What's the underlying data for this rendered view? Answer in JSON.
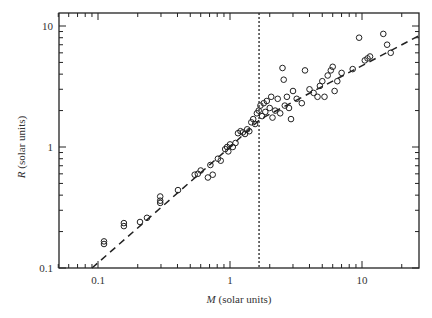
{
  "chart_data": {
    "type": "scatter",
    "title": "",
    "xlabel": "M (solar units)",
    "xlabel_var": "M",
    "xlabel_unit": " (solar units)",
    "ylabel": "R (solar units)",
    "ylabel_var": "R",
    "ylabel_unit": " (solar units)",
    "xscale": "log",
    "yscale": "log",
    "xlim": [
      0.05,
      27
    ],
    "ylim": [
      0.1,
      12.8
    ],
    "x_ticks": [
      0.1,
      1,
      10
    ],
    "x_tick_labels": [
      "0.1",
      "1",
      "10"
    ],
    "y_ticks": [
      0.1,
      1,
      10
    ],
    "y_tick_labels": [
      "0.1",
      "1",
      "10"
    ],
    "grid": false,
    "legend": null,
    "series": [
      {
        "name": "stars",
        "marker": "open-circle",
        "points": [
          [
            0.111,
            0.158
          ],
          [
            0.111,
            0.166
          ],
          [
            0.157,
            0.222
          ],
          [
            0.157,
            0.235
          ],
          [
            0.208,
            0.24
          ],
          [
            0.235,
            0.26
          ],
          [
            0.296,
            0.345
          ],
          [
            0.296,
            0.36
          ],
          [
            0.296,
            0.39
          ],
          [
            0.404,
            0.44
          ],
          [
            0.54,
            0.59
          ],
          [
            0.57,
            0.6
          ],
          [
            0.6,
            0.64
          ],
          [
            0.68,
            0.56
          ],
          [
            0.71,
            0.71
          ],
          [
            0.74,
            0.59
          ],
          [
            0.81,
            0.8
          ],
          [
            0.85,
            0.77
          ],
          [
            0.92,
            0.96
          ],
          [
            0.95,
            1.0
          ],
          [
            0.97,
            0.92
          ],
          [
            1.0,
            1.05
          ],
          [
            1.05,
            1.0
          ],
          [
            1.1,
            1.08
          ],
          [
            1.15,
            1.3
          ],
          [
            1.2,
            1.35
          ],
          [
            1.25,
            1.32
          ],
          [
            1.3,
            1.28
          ],
          [
            1.35,
            1.4
          ],
          [
            1.4,
            1.35
          ],
          [
            1.45,
            1.6
          ],
          [
            1.5,
            1.7
          ],
          [
            1.55,
            1.55
          ],
          [
            1.6,
            1.9
          ],
          [
            1.65,
            2.0
          ],
          [
            1.7,
            2.2
          ],
          [
            1.75,
            1.8
          ],
          [
            1.8,
            2.3
          ],
          [
            1.85,
            1.95
          ],
          [
            1.9,
            2.4
          ],
          [
            2.0,
            2.1
          ],
          [
            2.05,
            2.6
          ],
          [
            2.1,
            1.75
          ],
          [
            2.2,
            2.0
          ],
          [
            2.3,
            2.5
          ],
          [
            2.4,
            1.9
          ],
          [
            2.5,
            4.5
          ],
          [
            2.55,
            3.6
          ],
          [
            2.6,
            2.2
          ],
          [
            2.7,
            2.6
          ],
          [
            2.8,
            2.1
          ],
          [
            2.9,
            1.7
          ],
          [
            3.0,
            2.9
          ],
          [
            3.2,
            2.5
          ],
          [
            3.5,
            2.3
          ],
          [
            3.7,
            4.3
          ],
          [
            4.0,
            3.0
          ],
          [
            4.3,
            2.8
          ],
          [
            4.6,
            2.6
          ],
          [
            4.8,
            3.2
          ],
          [
            5.0,
            3.5
          ],
          [
            5.2,
            2.6
          ],
          [
            5.5,
            3.9
          ],
          [
            5.8,
            4.3
          ],
          [
            6.0,
            4.6
          ],
          [
            6.2,
            2.9
          ],
          [
            6.5,
            3.5
          ],
          [
            7.0,
            4.1
          ],
          [
            8.5,
            4.4
          ],
          [
            9.5,
            8.0
          ],
          [
            10.5,
            5.2
          ],
          [
            11.0,
            5.4
          ],
          [
            11.5,
            5.6
          ],
          [
            14.5,
            8.6
          ],
          [
            15.5,
            7.0
          ],
          [
            16.5,
            6.0
          ]
        ]
      }
    ],
    "fit_line": {
      "style": "dashed",
      "points": [
        [
          0.09,
          0.1
        ],
        [
          1.0,
          1.0
        ],
        [
          1.7,
          1.7
        ],
        [
          27,
          8.3
        ]
      ]
    },
    "vertical_marker": {
      "style": "dotted",
      "x": 1.66
    }
  }
}
